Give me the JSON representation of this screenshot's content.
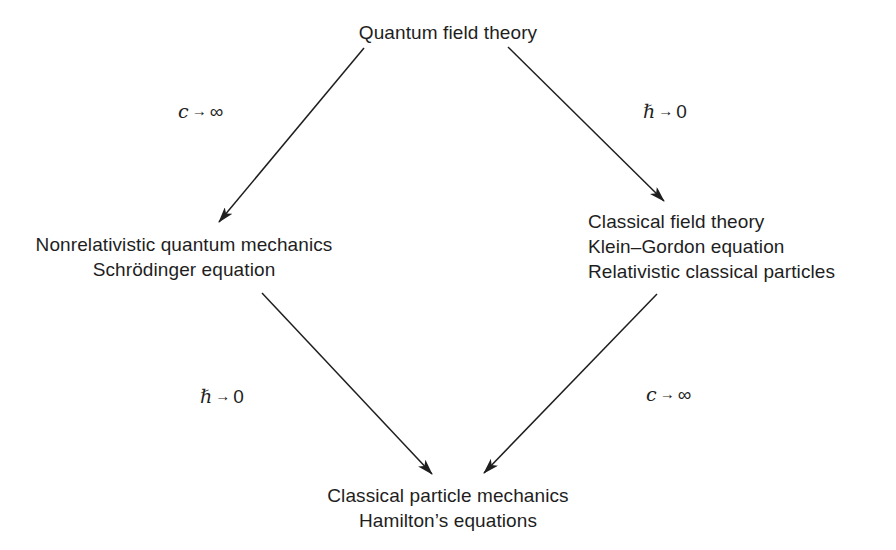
{
  "diagram": {
    "nodes": {
      "top": {
        "lines": [
          "Quantum field theory"
        ]
      },
      "left": {
        "lines": [
          "Nonrelativistic quantum mechanics",
          "Schrödinger equation"
        ]
      },
      "right": {
        "lines": [
          "Classical field theory",
          "Klein–Gordon equation",
          "Relativistic classical particles"
        ]
      },
      "bottom": {
        "lines": [
          "Classical particle mechanics",
          "Hamilton’s equations"
        ]
      }
    },
    "edges": [
      {
        "from": "top",
        "to": "left",
        "label": {
          "variable": "c",
          "arrow": "→",
          "limit": "∞"
        }
      },
      {
        "from": "top",
        "to": "right",
        "label": {
          "variable": "ℏ",
          "arrow": "→",
          "limit": "0"
        }
      },
      {
        "from": "left",
        "to": "bottom",
        "label": {
          "variable": "ℏ",
          "arrow": "→",
          "limit": "0"
        }
      },
      {
        "from": "right",
        "to": "bottom",
        "label": {
          "variable": "c",
          "arrow": "→",
          "limit": "∞"
        }
      }
    ],
    "colors": {
      "line": "#1e1e1e",
      "text": "#1e1e1e",
      "background": "#ffffff"
    }
  }
}
